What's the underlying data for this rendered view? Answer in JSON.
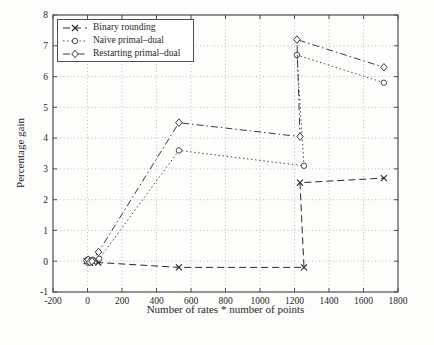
{
  "chart_data": {
    "type": "line",
    "title": "",
    "xlabel": "Number of rates * number of points",
    "ylabel": "Percentage gain",
    "xlim": [
      -200,
      1800
    ],
    "ylim": [
      -1,
      8
    ],
    "xticks": [
      -200,
      0,
      200,
      400,
      600,
      800,
      1000,
      1200,
      1400,
      1600,
      1800
    ],
    "yticks": [
      -1,
      0,
      1,
      2,
      3,
      4,
      5,
      6,
      7,
      8
    ],
    "grid": true,
    "grid_style": "dotted",
    "legend_position": "upper-left",
    "series": [
      {
        "name": "Binary rounding",
        "marker": "x",
        "line_style": "dashed",
        "color": "#2b2b2b",
        "points": [
          [
            -5,
            0
          ],
          [
            5,
            0
          ],
          [
            14,
            -0.05
          ],
          [
            28,
            0
          ],
          [
            62,
            -0.04
          ],
          [
            530,
            -0.2
          ],
          [
            1255,
            -0.2
          ],
          [
            1232,
            2.55
          ],
          [
            1718,
            2.7
          ]
        ]
      },
      {
        "name": "Naive primal–dual",
        "marker": "circle",
        "line_style": "dotted",
        "color": "#4a4a4a",
        "points": [
          [
            -3,
            0
          ],
          [
            6,
            -0.05
          ],
          [
            16,
            0.02
          ],
          [
            30,
            0.05
          ],
          [
            68,
            0.08
          ],
          [
            530,
            3.6
          ],
          [
            1255,
            3.1
          ],
          [
            1214,
            6.7
          ],
          [
            1718,
            5.8
          ]
        ]
      },
      {
        "name": "Restarting primal–dual",
        "marker": "diamond",
        "line_style": "dashdot",
        "color": "#3a3a3a",
        "points": [
          [
            -6,
            0.02
          ],
          [
            4,
            0.05
          ],
          [
            13,
            -0.03
          ],
          [
            26,
            0
          ],
          [
            64,
            0.3
          ],
          [
            530,
            4.5
          ],
          [
            1232,
            4.05
          ],
          [
            1214,
            7.2
          ],
          [
            1718,
            6.3
          ]
        ]
      }
    ],
    "colors": {
      "frame": "#4d4d4d",
      "grid": "#bdbdbd",
      "tick_text": "#1f1f1f",
      "background": "#fdfdfc",
      "marker_fill": "#ffffff"
    }
  }
}
